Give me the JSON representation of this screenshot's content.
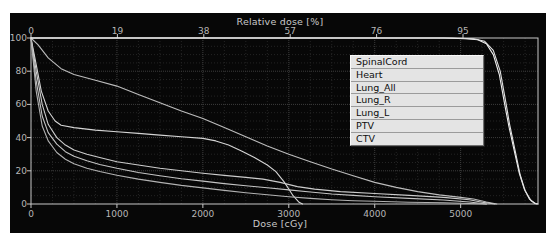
{
  "figure": {
    "background": "#ffffff",
    "panel_background": "#070707",
    "axis_color": "#c8c8c8",
    "tick_label_color": "#b6b6b6",
    "legend_background": "#e4e4e4",
    "legend_text_color": "#0d0d0d"
  },
  "chart_data": {
    "type": "line",
    "top_axis": {
      "title": "Relative dose [%]",
      "ticks": [
        0,
        19,
        38,
        57,
        76,
        95
      ],
      "max": 95
    },
    "x_axis": {
      "title": "Dose [cGy]",
      "ticks": [
        0,
        1000,
        2000,
        3000,
        4000,
        5000
      ],
      "max": 5900,
      "minor_step": 250
    },
    "y_axis": {
      "title": "",
      "ticks": [
        0,
        20,
        40,
        60,
        80,
        100
      ],
      "max": 100,
      "minor_step": 5
    },
    "grid": {
      "on": true,
      "major_color": "#3d3d3d",
      "minor_color": "#242424"
    },
    "legend": {
      "position": "upper-right",
      "items": [
        "SpinalCord",
        "Heart",
        "Lung_All",
        "Lung_R",
        "Lung_L",
        "PTV",
        "CTV"
      ]
    },
    "series": [
      {
        "name": "SpinalCord",
        "color": "#d4d4d4",
        "points": [
          [
            0,
            100
          ],
          [
            60,
            84
          ],
          [
            120,
            68
          ],
          [
            200,
            56
          ],
          [
            280,
            50
          ],
          [
            350,
            47.5
          ],
          [
            500,
            46
          ],
          [
            750,
            44.5
          ],
          [
            1000,
            43.5
          ],
          [
            1250,
            42.5
          ],
          [
            1500,
            41.5
          ],
          [
            1750,
            40.5
          ],
          [
            2000,
            39.5
          ],
          [
            2150,
            38
          ],
          [
            2300,
            35.5
          ],
          [
            2450,
            32
          ],
          [
            2600,
            28
          ],
          [
            2750,
            23.5
          ],
          [
            2850,
            19.5
          ],
          [
            2950,
            13
          ],
          [
            3050,
            5
          ],
          [
            3120,
            1
          ],
          [
            3160,
            0
          ]
        ]
      },
      {
        "name": "Heart",
        "color": "#bcbcbc",
        "points": [
          [
            0,
            100
          ],
          [
            80,
            96
          ],
          [
            200,
            88
          ],
          [
            350,
            81.5
          ],
          [
            500,
            78
          ],
          [
            750,
            74.5
          ],
          [
            1000,
            71
          ],
          [
            1250,
            66
          ],
          [
            1500,
            61
          ],
          [
            1750,
            56
          ],
          [
            2000,
            51.5
          ],
          [
            2250,
            46
          ],
          [
            2500,
            40.5
          ],
          [
            2750,
            35
          ],
          [
            3000,
            30
          ],
          [
            3250,
            25.5
          ],
          [
            3500,
            21
          ],
          [
            3750,
            17
          ],
          [
            4000,
            13
          ],
          [
            4250,
            10
          ],
          [
            4500,
            7.5
          ],
          [
            4750,
            5.5
          ],
          [
            5000,
            4
          ],
          [
            5150,
            3
          ],
          [
            5300,
            1.2
          ],
          [
            5420,
            0
          ]
        ]
      },
      {
        "name": "Lung_All",
        "color": "#cccccc",
        "points": [
          [
            0,
            100
          ],
          [
            60,
            80
          ],
          [
            130,
            60
          ],
          [
            200,
            48
          ],
          [
            300,
            40
          ],
          [
            400,
            35.5
          ],
          [
            500,
            32.5
          ],
          [
            650,
            30
          ],
          [
            800,
            28
          ],
          [
            1000,
            25.5
          ],
          [
            1250,
            23.5
          ],
          [
            1500,
            21.5
          ],
          [
            1750,
            20
          ],
          [
            2000,
            18.5
          ],
          [
            2250,
            17.2
          ],
          [
            2500,
            16
          ],
          [
            2700,
            15
          ],
          [
            2900,
            13
          ],
          [
            3100,
            10.5
          ],
          [
            3300,
            9
          ],
          [
            3600,
            7.5
          ],
          [
            4000,
            6.3
          ],
          [
            4400,
            5.2
          ],
          [
            4800,
            4
          ],
          [
            5100,
            2.5
          ],
          [
            5250,
            1
          ],
          [
            5400,
            0
          ]
        ]
      },
      {
        "name": "Lung_R",
        "color": "#c3c3c3",
        "points": [
          [
            0,
            100
          ],
          [
            60,
            74
          ],
          [
            130,
            53
          ],
          [
            200,
            43
          ],
          [
            300,
            36
          ],
          [
            400,
            31.5
          ],
          [
            500,
            28.8
          ],
          [
            650,
            26
          ],
          [
            800,
            23.8
          ],
          [
            1000,
            21.5
          ],
          [
            1250,
            19
          ],
          [
            1500,
            17
          ],
          [
            1750,
            15.2
          ],
          [
            2000,
            13.8
          ],
          [
            2250,
            12.3
          ],
          [
            2500,
            11
          ],
          [
            2750,
            9.8
          ],
          [
            3000,
            8.5
          ],
          [
            3250,
            7.2
          ],
          [
            3500,
            6
          ],
          [
            3750,
            5.2
          ],
          [
            4000,
            4.4
          ],
          [
            4400,
            3.4
          ],
          [
            4800,
            2.4
          ],
          [
            5100,
            1.2
          ],
          [
            5300,
            0
          ]
        ]
      },
      {
        "name": "Lung_L",
        "color": "#b2b2b2",
        "points": [
          [
            0,
            100
          ],
          [
            60,
            68
          ],
          [
            130,
            47
          ],
          [
            200,
            38
          ],
          [
            300,
            31
          ],
          [
            400,
            27
          ],
          [
            500,
            24.2
          ],
          [
            650,
            21.5
          ],
          [
            800,
            19.6
          ],
          [
            1000,
            17.3
          ],
          [
            1250,
            15
          ],
          [
            1500,
            13
          ],
          [
            1750,
            11.2
          ],
          [
            2000,
            9.7
          ],
          [
            2250,
            8.2
          ],
          [
            2500,
            6.8
          ],
          [
            2750,
            5.6
          ],
          [
            3000,
            4.4
          ],
          [
            3250,
            3.4
          ],
          [
            3500,
            2.6
          ],
          [
            3750,
            2
          ],
          [
            4000,
            1.6
          ],
          [
            4400,
            1.1
          ],
          [
            4800,
            0.7
          ],
          [
            5100,
            0.3
          ],
          [
            5300,
            0
          ]
        ]
      },
      {
        "name": "PTV",
        "color": "#f0f0f0",
        "points": [
          [
            0,
            100
          ],
          [
            4800,
            100
          ],
          [
            5050,
            99.6
          ],
          [
            5200,
            99
          ],
          [
            5300,
            96.5
          ],
          [
            5380,
            90
          ],
          [
            5450,
            78
          ],
          [
            5520,
            58
          ],
          [
            5560,
            47
          ],
          [
            5620,
            33
          ],
          [
            5680,
            19
          ],
          [
            5740,
            9
          ],
          [
            5800,
            3
          ],
          [
            5860,
            0.5
          ],
          [
            5900,
            0
          ]
        ]
      },
      {
        "name": "CTV",
        "color": "#e2e2e2",
        "points": [
          [
            0,
            100
          ],
          [
            4900,
            100
          ],
          [
            5150,
            99.5
          ],
          [
            5280,
            98
          ],
          [
            5380,
            92.5
          ],
          [
            5460,
            80
          ],
          [
            5530,
            60
          ],
          [
            5570,
            48
          ],
          [
            5630,
            33
          ],
          [
            5690,
            18
          ],
          [
            5750,
            8
          ],
          [
            5820,
            2
          ],
          [
            5880,
            0
          ]
        ]
      }
    ]
  }
}
